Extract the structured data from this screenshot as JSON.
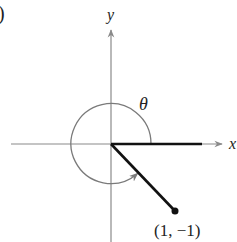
{
  "figure": {
    "part_label": ")",
    "axes": {
      "x_label": "x",
      "y_label": "y"
    },
    "angle_label": "θ",
    "point": {
      "label": "(1, −1)",
      "x": 1,
      "y": -1
    },
    "colors": {
      "axis": "#8a8a8a",
      "arc": "#7a7a7a",
      "ray": "#111111",
      "text": "#222222"
    }
  }
}
